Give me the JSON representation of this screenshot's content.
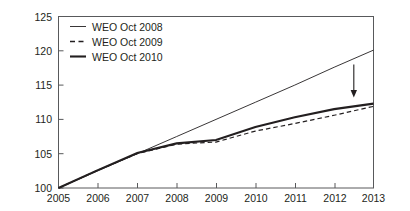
{
  "chart_data": {
    "type": "line",
    "title": "",
    "subtitle": "",
    "xlabel": "",
    "ylabel": "",
    "xlim": [
      2005,
      2013
    ],
    "ylim": [
      100,
      125
    ],
    "x_ticks": [
      "2005",
      "2006",
      "2007",
      "2008",
      "2009",
      "2010",
      "2011",
      "2012",
      "2013"
    ],
    "y_ticks": [
      "100",
      "105",
      "110",
      "115",
      "120",
      "125"
    ],
    "grid": false,
    "legend_position": "top-left",
    "x": [
      2005,
      2006,
      2007,
      2008,
      2009,
      2010,
      2011,
      2012,
      2013
    ],
    "series": [
      {
        "name": "WEO Oct 2008",
        "style": "solid-thin",
        "values": [
          100.0,
          102.5,
          105.0,
          107.5,
          110.0,
          112.5,
          115.0,
          117.6,
          120.1
        ]
      },
      {
        "name": "WEO Oct 2009",
        "style": "dashed",
        "values": [
          100.0,
          102.6,
          105.0,
          106.4,
          106.7,
          108.3,
          109.4,
          110.6,
          111.9
        ]
      },
      {
        "name": "WEO Oct 2010",
        "style": "solid-thick",
        "values": [
          100.0,
          102.6,
          105.1,
          106.5,
          107.0,
          108.9,
          110.3,
          111.5,
          112.3
        ]
      }
    ],
    "annotations": [
      {
        "type": "arrow",
        "direction": "down",
        "x": 2012.5,
        "y_start": 118.0,
        "y_end": 113.2,
        "label": ""
      }
    ]
  },
  "legend": {
    "entries": [
      {
        "label": "WEO Oct 2008",
        "marker": "solid-thin-line-icon"
      },
      {
        "label": "WEO Oct 2009",
        "marker": "dashed-line-icon"
      },
      {
        "label": "WEO Oct 2010",
        "marker": "solid-thick-line-icon"
      }
    ]
  },
  "axes": {
    "y": {
      "labels": [
        "125",
        "120",
        "115",
        "110",
        "105",
        "100"
      ]
    },
    "x": {
      "labels": [
        "2005",
        "2006",
        "2007",
        "2008",
        "2009",
        "2010",
        "2011",
        "2012",
        "2013"
      ]
    }
  }
}
